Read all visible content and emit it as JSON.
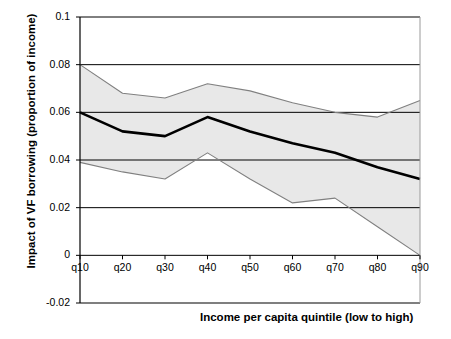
{
  "chart_data": {
    "type": "line",
    "title": "",
    "xlabel": "Income per capita quintile (low to high)",
    "ylabel": "Impact of VF borrowing (proportion of income)",
    "categories": [
      "q10",
      "q20",
      "q30",
      "q40",
      "q50",
      "q60",
      "q70",
      "q80",
      "q90"
    ],
    "ylim": [
      -0.02,
      0.1
    ],
    "yticks": [
      "0.1",
      "0.08",
      "0.06",
      "0.04",
      "0.02",
      "0",
      "-0.02"
    ],
    "ytick_values": [
      0.1,
      0.08,
      0.06,
      0.04,
      0.02,
      0,
      -0.02
    ],
    "grid": "horizontal gridlines at 0.02, 0.04, 0.06, 0.08",
    "legend": "none",
    "series": [
      {
        "name": "Upper confidence bound",
        "values": [
          0.08,
          0.068,
          0.066,
          0.072,
          0.069,
          0.064,
          0.06,
          0.058,
          0.065
        ],
        "style": "thin-gray-line"
      },
      {
        "name": "Central estimate",
        "values": [
          0.06,
          0.052,
          0.05,
          0.058,
          0.052,
          0.047,
          0.043,
          0.037,
          0.032
        ],
        "style": "thick-black-line"
      },
      {
        "name": "Lower confidence bound",
        "values": [
          0.039,
          0.035,
          0.032,
          0.043,
          0.032,
          0.022,
          0.024,
          0.012,
          0.0
        ],
        "style": "thin-gray-line"
      }
    ],
    "band_fill_color": "#e8e8e8",
    "line_color": "#000000",
    "bound_line_color": "#808080",
    "grid_color": "#000000",
    "axis_color": "#000000"
  }
}
